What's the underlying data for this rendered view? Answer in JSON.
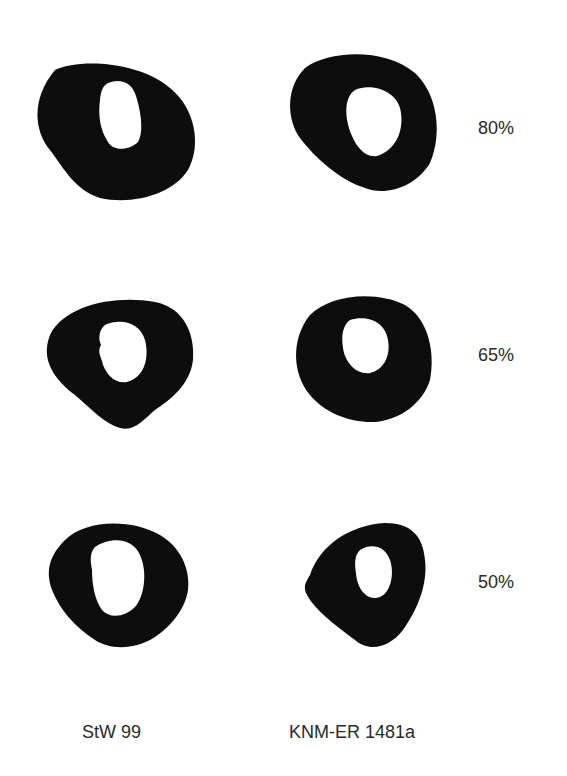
{
  "figure": {
    "columns": [
      {
        "id": "stw99",
        "label": "StW 99"
      },
      {
        "id": "knm",
        "label": "KNM-ER 1481a"
      }
    ],
    "rows": [
      {
        "level": "80%"
      },
      {
        "level": "65%"
      },
      {
        "level": "50%"
      }
    ],
    "colors": {
      "bone": "#0d0d0d",
      "canal": "#ffffff",
      "background": "#ffffff",
      "text": "#2a2a2a"
    }
  }
}
